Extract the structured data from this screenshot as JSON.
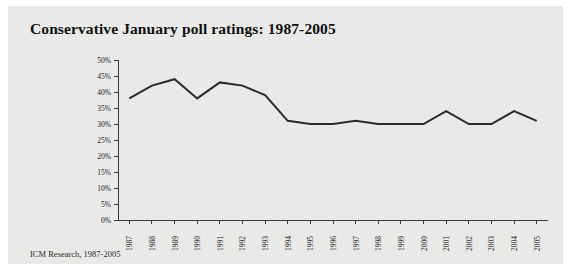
{
  "figure": {
    "background_color": "#e9e9e7",
    "page_background_color": "#ffffff",
    "title": "Conservative January poll ratings: 1987-2005",
    "source_caption": "ICM Research, 1987-2005"
  },
  "chart_data": {
    "type": "line",
    "title": "Conservative January poll ratings: 1987-2005",
    "subtitle": "",
    "xlabel": "",
    "ylabel": "",
    "categories": [
      "1987",
      "1988",
      "1989",
      "1990",
      "1991",
      "1992",
      "1993",
      "1994",
      "1995",
      "1996",
      "1997",
      "1998",
      "1999",
      "2000",
      "2001",
      "2002",
      "2003",
      "2004",
      "2005"
    ],
    "values": [
      38,
      42,
      44,
      38,
      43,
      42,
      39,
      31,
      30,
      30,
      31,
      30,
      30,
      30,
      34,
      30,
      30,
      34,
      31
    ],
    "value_suffix": "%",
    "ylim": [
      0,
      50
    ],
    "ytick_values": [
      0,
      5,
      10,
      15,
      20,
      25,
      30,
      35,
      40,
      45,
      50
    ],
    "ytick_labels": [
      "0%",
      "5%",
      "10%",
      "15%",
      "20%",
      "25%",
      "30%",
      "35%",
      "40%",
      "45%",
      "50%"
    ],
    "xtick_labels": [
      "1987",
      "1988",
      "1989",
      "1990",
      "1991",
      "1992",
      "1993",
      "1994",
      "1995",
      "1996",
      "1997",
      "1998",
      "1999",
      "2000",
      "2001",
      "2002",
      "2003",
      "2004",
      "2005"
    ],
    "xtick_rotation": -90,
    "grid": false,
    "legend": false,
    "legend_position": "none",
    "line_color": "#2b2b2b",
    "axis_color": "#3a3a3a",
    "series": [
      {
        "name": "Conservative poll rating",
        "values": [
          38,
          42,
          44,
          38,
          43,
          42,
          39,
          31,
          30,
          30,
          31,
          30,
          30,
          30,
          34,
          30,
          30,
          34,
          31
        ]
      }
    ]
  }
}
